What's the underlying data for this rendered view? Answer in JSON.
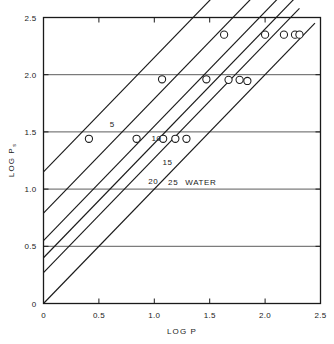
{
  "chart_data": {
    "type": "line",
    "title": "",
    "xlabel": "LOG P",
    "ylabel": "LOG P",
    "ylabel_subscript": "s",
    "xlim": [
      0,
      2.5
    ],
    "ylim": [
      0,
      2.5
    ],
    "grid": "horizontal gridlines at 0.5, 1.0, 1.5, 2.0",
    "legend": "inline labels placed along each line",
    "xticks": [
      "0",
      "0.5",
      "1.0",
      "1.5",
      "2.0",
      "2.5"
    ],
    "xtick_values": [
      0,
      0.5,
      1.0,
      1.5,
      2.0,
      2.5
    ],
    "yticks": [
      "0",
      "0.5",
      "1.0",
      "1.5",
      "2.0",
      "2.5"
    ],
    "ytick_values": [
      0,
      0.5,
      1.0,
      1.5,
      2.0,
      2.5
    ],
    "series": [
      {
        "name": "5",
        "label": "5",
        "label_x": 0.62,
        "label_y": 1.545,
        "intercept": 1.15,
        "slope": 1.0,
        "line_x": [
          0.0,
          1.63
        ],
        "points": [
          {
            "x": 0.41,
            "y": 1.44
          },
          {
            "x": 1.07,
            "y": 1.96
          },
          {
            "x": 1.63,
            "y": 2.35
          }
        ]
      },
      {
        "name": "10",
        "label": "10",
        "label_x": 1.02,
        "label_y": 1.42,
        "intercept": 0.79,
        "slope": 1.0,
        "line_x": [
          0.0,
          2.0
        ],
        "points": [
          {
            "x": 0.84,
            "y": 1.44
          },
          {
            "x": 1.47,
            "y": 1.96
          },
          {
            "x": 2.0,
            "y": 2.35
          }
        ]
      },
      {
        "name": "15",
        "label": "15",
        "label_x": 1.12,
        "label_y": 1.21,
        "intercept": 0.55,
        "slope": 1.0,
        "line_x": [
          0.0,
          2.17
        ],
        "points": [
          {
            "x": 1.08,
            "y": 1.44
          },
          {
            "x": 1.67,
            "y": 1.955
          },
          {
            "x": 2.17,
            "y": 2.35
          }
        ]
      },
      {
        "name": "20",
        "label": "20",
        "label_x": 0.99,
        "label_y": 1.045,
        "intercept": 0.4,
        "slope": 1.0,
        "line_x": [
          0.0,
          2.27
        ],
        "points": [
          {
            "x": 1.19,
            "y": 1.44
          },
          {
            "x": 1.77,
            "y": 1.955
          },
          {
            "x": 2.27,
            "y": 2.35
          }
        ]
      },
      {
        "name": "25",
        "label": "25",
        "label_x": 1.17,
        "label_y": 1.04,
        "intercept": 0.27,
        "slope": 1.0,
        "line_x": [
          0.0,
          2.31
        ],
        "points": [
          {
            "x": 1.29,
            "y": 1.44
          },
          {
            "x": 1.84,
            "y": 1.945
          },
          {
            "x": 2.31,
            "y": 2.35
          }
        ]
      },
      {
        "name": "WATER",
        "label": "WATER",
        "label_x": 1.42,
        "label_y": 1.04,
        "intercept": 0.0,
        "slope": 1.0,
        "line_x": [
          0.0,
          2.45
        ],
        "points": []
      }
    ]
  }
}
